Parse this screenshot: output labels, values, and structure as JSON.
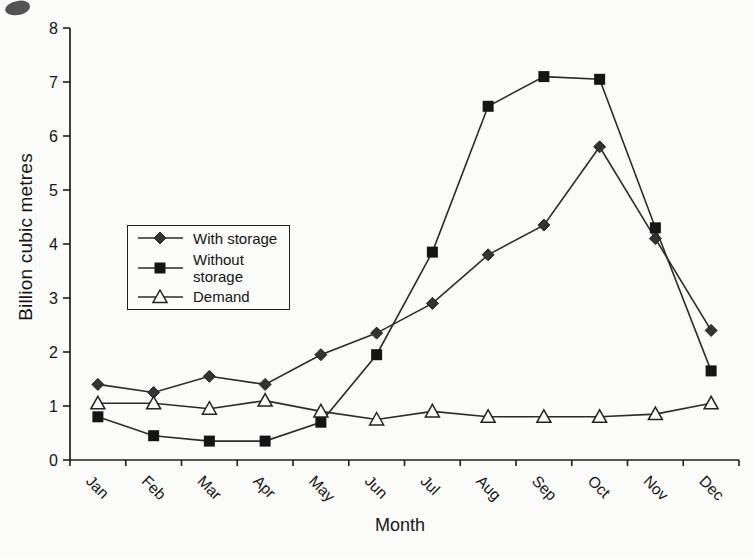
{
  "page": {
    "background": "#fbfbf9",
    "ink": "#1e1e1e"
  },
  "chart_data": {
    "type": "line",
    "title": "",
    "xlabel": "Month",
    "ylabel": "Billion cubic metres",
    "ylim": [
      0,
      8
    ],
    "ytick_step": 1,
    "grid": false,
    "legend_position": "middle-left",
    "line_color": "#2b2b2b",
    "categories": [
      "Jan",
      "Feb",
      "Mar",
      "Apr",
      "May",
      "Jun",
      "Jul",
      "Aug",
      "Sep",
      "Oct",
      "Nov",
      "Dec"
    ],
    "series": [
      {
        "name": "With storage",
        "marker": "diamond-filled",
        "color": "#333333",
        "values": [
          1.4,
          1.25,
          1.55,
          1.4,
          1.95,
          2.35,
          2.9,
          3.8,
          4.35,
          5.8,
          4.1,
          2.4
        ]
      },
      {
        "name": "Without storage",
        "marker": "square-filled",
        "color": "#151515",
        "values": [
          0.8,
          0.45,
          0.35,
          0.35,
          0.7,
          1.95,
          3.85,
          6.55,
          7.1,
          7.05,
          4.3,
          1.65
        ]
      },
      {
        "name": "Demand",
        "marker": "triangle-open",
        "color": "#ffffff",
        "values": [
          1.05,
          1.05,
          0.95,
          1.1,
          0.9,
          0.75,
          0.9,
          0.8,
          0.8,
          0.8,
          0.85,
          1.05
        ]
      }
    ]
  }
}
